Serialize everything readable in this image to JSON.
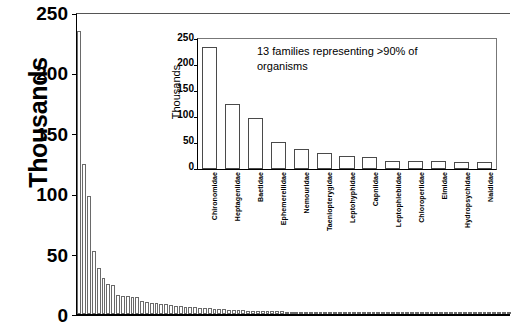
{
  "chart_data": {
    "type": "bar",
    "title": "",
    "subtitle": "",
    "ylabel": "Thousands",
    "xlabel": "",
    "ylim": [
      0,
      250
    ],
    "yticks": [
      0,
      50,
      100,
      150,
      200,
      250
    ],
    "grid": false,
    "legend": null,
    "note": "Rank-abundance distribution of macroinvertebrate families; long tail of ~90 families",
    "categories": [
      "1",
      "2",
      "3",
      "4",
      "5",
      "6",
      "7",
      "8",
      "9",
      "10",
      "11",
      "12",
      "13",
      "14",
      "15",
      "16",
      "17",
      "18",
      "19",
      "20",
      "21",
      "22",
      "23",
      "24",
      "25",
      "26",
      "27",
      "28",
      "29",
      "30",
      "31",
      "32",
      "33",
      "34",
      "35",
      "36",
      "37",
      "38",
      "39",
      "40",
      "41",
      "42",
      "43",
      "44",
      "45",
      "46",
      "47",
      "48",
      "49",
      "50",
      "51",
      "52",
      "53",
      "54",
      "55",
      "56",
      "57",
      "58",
      "59",
      "60",
      "61",
      "62",
      "63",
      "64",
      "65",
      "66",
      "67",
      "68",
      "69",
      "70",
      "71",
      "72",
      "73",
      "74",
      "75",
      "76",
      "77",
      "78",
      "79",
      "80",
      "81",
      "82",
      "83",
      "84",
      "85",
      "86",
      "87",
      "88",
      "89",
      "90"
    ],
    "values": [
      235,
      125,
      98,
      52,
      38,
      30,
      25,
      24,
      16,
      15,
      15,
      14,
      14,
      11,
      10,
      9.5,
      9,
      8.5,
      8,
      7.5,
      7,
      6.6,
      6.2,
      5.9,
      5.5,
      5.2,
      4.9,
      4.6,
      4.3,
      4.1,
      3.9,
      3.7,
      3.5,
      3.3,
      3.1,
      2.9,
      2.8,
      2.6,
      2.5,
      2.4,
      2.3,
      2.2,
      2.1,
      2.0,
      1.9,
      1.8,
      1.7,
      1.65,
      1.6,
      1.55,
      1.5,
      1.45,
      1.4,
      1.35,
      1.3,
      1.25,
      1.2,
      1.15,
      1.1,
      1.05,
      1.0,
      0.95,
      0.9,
      0.88,
      0.85,
      0.82,
      0.8,
      0.77,
      0.74,
      0.71,
      0.68,
      0.65,
      0.62,
      0.6,
      0.57,
      0.55,
      0.52,
      0.5,
      0.48,
      0.45,
      0.43,
      0.4,
      0.38,
      0.35,
      0.33,
      0.3,
      0.27,
      0.24,
      0.2,
      0.16
    ]
  },
  "main_chart": {
    "ylabel": "Thousands",
    "yticks": [
      "0",
      "50",
      "100",
      "150",
      "200",
      "250"
    ]
  },
  "inset_chart": {
    "ylabel": "Thousands",
    "yticks": [
      "0",
      "50",
      "100",
      "150",
      "200",
      "250"
    ],
    "annotation": "13 families representing >90% of organisms",
    "chart_data": {
      "type": "bar",
      "ylabel": "Thousands",
      "ylim": [
        0,
        250
      ],
      "yticks": [
        0,
        50,
        100,
        150,
        200,
        250
      ],
      "grid": false,
      "categories": [
        "Chironomidae",
        "Heptageniidae",
        "Baetidae",
        "Ephemerellidae",
        "Nemouridae",
        "Taeniopterygidae",
        "Leptohyphidae",
        "Capniidae",
        "Leptophlebiidae",
        "Chloroperlidae",
        "Elmidae",
        "Hydropsychidae",
        "Naididae"
      ],
      "values": [
        235,
        125,
        98,
        52,
        38,
        30,
        25,
        24,
        16,
        15,
        16,
        14,
        14
      ]
    }
  }
}
